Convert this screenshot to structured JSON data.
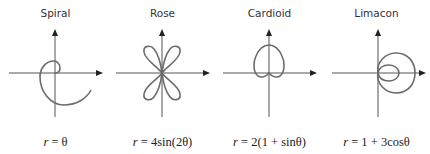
{
  "figure": {
    "panels": [
      {
        "title": "Spiral",
        "equation": "r = θ",
        "eq_var": "r",
        "eq_body": " = θ",
        "curve": "spiral"
      },
      {
        "title": "Rose",
        "equation": "r = 4sin(2θ)",
        "eq_var": "r",
        "eq_body": " = 4sin(2θ)",
        "curve": "rose"
      },
      {
        "title": "Cardioid",
        "equation": "r = 2(1 + sinθ)",
        "eq_var": "r",
        "eq_body": " = 2(1 + sinθ)",
        "curve": "cardioid"
      },
      {
        "title": "Limacon",
        "equation": "r = 1 + 3cosθ",
        "eq_var": "r",
        "eq_body": " = 1 + 3cosθ",
        "curve": "limacon"
      }
    ],
    "colors": {
      "curve": "#6b6b6b",
      "axis": "#555555",
      "arrow": "#222222",
      "text": "#333333"
    }
  }
}
